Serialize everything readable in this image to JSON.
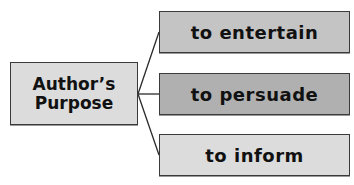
{
  "diagram": {
    "type": "tree",
    "root": {
      "label_line1": "Author’s",
      "label_line2": "Purpose",
      "fill": "#dcdcdc"
    },
    "branches": [
      {
        "label": "to entertain",
        "fill": "#c4c4c4"
      },
      {
        "label": "to persuade",
        "fill": "#b0b0b0"
      },
      {
        "label": "to inform",
        "fill": "#dcdcdc"
      }
    ],
    "line_color": "#2a2a2a",
    "border_color": "#3a3a3a"
  }
}
